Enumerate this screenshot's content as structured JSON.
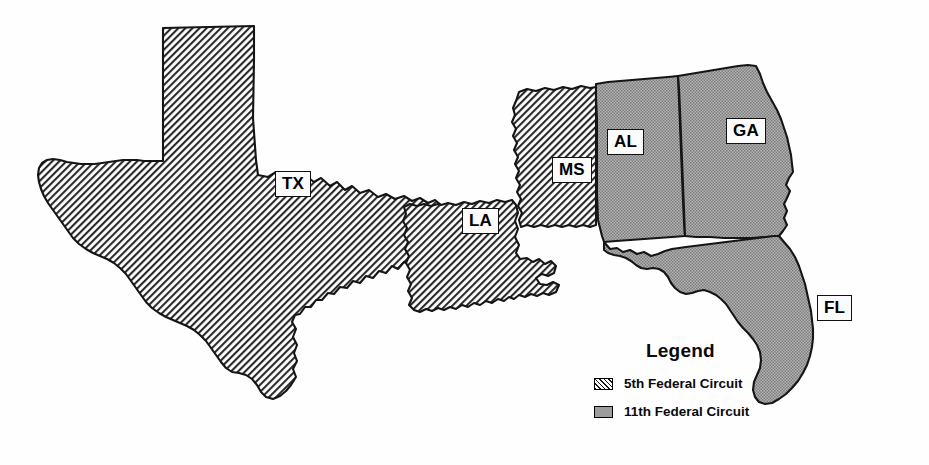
{
  "map": {
    "title": "Federal Judicial Circuits — 5th and 11th",
    "projection_note": "Southeastern United States",
    "background_color": "#ffffff",
    "outline_color": "#151515",
    "states": [
      {
        "code": "TX",
        "name": "Texas",
        "circuit": "5th Federal Circuit",
        "fill": "hatch",
        "label_x": 275,
        "label_y": 182
      },
      {
        "code": "LA",
        "name": "Louisiana",
        "circuit": "5th Federal Circuit",
        "fill": "hatch",
        "label_x": 462,
        "label_y": 219
      },
      {
        "code": "MS",
        "name": "Mississippi",
        "circuit": "5th Federal Circuit",
        "fill": "hatch",
        "label_x": 552,
        "label_y": 168
      },
      {
        "code": "AL",
        "name": "Alabama",
        "circuit": "11th Federal Circuit",
        "fill": "gray",
        "label_x": 607,
        "label_y": 140
      },
      {
        "code": "GA",
        "name": "Georgia",
        "circuit": "11th Federal Circuit",
        "fill": "gray",
        "label_x": 726,
        "label_y": 129
      },
      {
        "code": "FL",
        "name": "Florida",
        "circuit": "11th Federal Circuit",
        "fill": "gray",
        "label_x": 817,
        "label_y": 306
      }
    ]
  },
  "legend": {
    "title": "Legend",
    "entries": [
      {
        "label": "5th Federal Circuit",
        "pattern": "diagonal-hatch",
        "color": "#1a1a1a"
      },
      {
        "label": "11th Federal Circuit",
        "pattern": "solid-gray",
        "color": "#9d9d9d"
      }
    ]
  }
}
